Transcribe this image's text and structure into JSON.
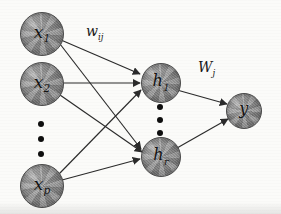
{
  "figure": {
    "type": "neural-network-diagram",
    "background_color": "#fbfbf9",
    "node_fill_color": "#8e8e8e",
    "node_border_color": "#4a4a4a",
    "edge_color": "#2b2b2b",
    "text_color": "#131313",
    "width": 281,
    "height": 214
  },
  "layers": [
    {
      "name": "input-layer",
      "nodes": [
        {
          "id": "x1",
          "base": "x",
          "sub": "1",
          "cx": 41,
          "cy": 33,
          "r": 21
        },
        {
          "id": "x2",
          "base": "x",
          "sub": "2",
          "cx": 41,
          "cy": 83,
          "r": 21
        },
        {
          "id": "xp",
          "base": "x",
          "sub": "p",
          "cx": 41,
          "cy": 185,
          "r": 21
        }
      ],
      "ellipsis": {
        "id": "input-ellipsis",
        "cx": 41,
        "cy": 138,
        "dots": 3,
        "dot_size": 6,
        "gap": 9
      }
    },
    {
      "name": "hidden-layer",
      "nodes": [
        {
          "id": "h1",
          "base": "h",
          "sub": "1",
          "cx": 160,
          "cy": 82,
          "r": 19
        },
        {
          "id": "hr",
          "base": "h",
          "sub": "r",
          "cx": 160,
          "cy": 156,
          "r": 19
        }
      ],
      "ellipsis": {
        "id": "hidden-ellipsis",
        "cx": 160,
        "cy": 119,
        "dots": 3,
        "dot_size": 6,
        "gap": 7
      }
    },
    {
      "name": "output-layer",
      "nodes": [
        {
          "id": "y",
          "base": "y",
          "sub": "",
          "cx": 243,
          "cy": 110,
          "r": 17
        }
      ],
      "ellipsis": null
    }
  ],
  "edges": [
    {
      "id": "x1-h1",
      "from": "x1",
      "to": "h1"
    },
    {
      "id": "x1-hr",
      "from": "x1",
      "to": "hr"
    },
    {
      "id": "x2-h1",
      "from": "x2",
      "to": "h1"
    },
    {
      "id": "x2-hr",
      "from": "x2",
      "to": "hr"
    },
    {
      "id": "xp-h1",
      "from": "xp",
      "to": "h1"
    },
    {
      "id": "xp-hr",
      "from": "xp",
      "to": "hr"
    },
    {
      "id": "h1-y",
      "from": "h1",
      "to": "y"
    },
    {
      "id": "hr-y",
      "from": "hr",
      "to": "y"
    }
  ],
  "labels": {
    "input_to_hidden_weight": {
      "base": "w",
      "sub": "ij",
      "x": 86,
      "y": 24,
      "size": 14
    },
    "hidden_to_output_weight": {
      "base": "W",
      "sub": "j",
      "x": 198,
      "y": 60,
      "size": 14
    }
  }
}
